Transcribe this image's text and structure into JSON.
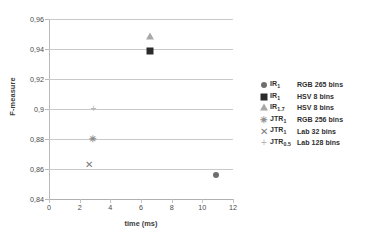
{
  "chart_data": {
    "type": "scatter",
    "title": "",
    "xlabel": "time (ms)",
    "ylabel": "F-measure",
    "xlim": [
      0,
      12
    ],
    "ylim": [
      0.84,
      0.96
    ],
    "x_ticks": [
      "0",
      "2",
      "4",
      "6",
      "8",
      "10",
      "12"
    ],
    "x_tick_values": [
      0,
      2,
      4,
      6,
      8,
      10,
      12
    ],
    "y_ticks": [
      "0,84",
      "0,86",
      "0,88",
      "0,9",
      "0,92",
      "0,94",
      "0,96"
    ],
    "y_tick_values": [
      0.84,
      0.86,
      0.88,
      0.9,
      0.92,
      0.94,
      0.96
    ],
    "grid": "horizontal",
    "legend_position": "right",
    "decimal_separator": ",",
    "series": [
      {
        "name": "IR1 RGB 265 bins",
        "label_name": "IR",
        "label_sub": "1",
        "label_desc": "RGB 265 bins",
        "marker": "circle",
        "color": "#6e6e6e",
        "x": [
          10.9
        ],
        "y": [
          0.856
        ]
      },
      {
        "name": "IR1 HSV 8 bins",
        "label_name": "IR",
        "label_sub": "1",
        "label_desc": "HSV 8 bins",
        "marker": "square",
        "color": "#2b2b2b",
        "x": [
          6.6
        ],
        "y": [
          0.939
        ]
      },
      {
        "name": "IR1.7 HSV 8 bins",
        "label_name": "IR",
        "label_sub": "1.7",
        "label_desc": "HSV 8 bins",
        "marker": "triangle",
        "color": "#a8a8a8",
        "x": [
          6.6
        ],
        "y": [
          0.948
        ]
      },
      {
        "name": "JTR1 RGB 256 bins",
        "label_name": "JTR",
        "label_sub": "1",
        "label_desc": "RGB 256 bins",
        "marker": "asterisk",
        "glyph": "✳",
        "color": "#8c8c8c",
        "x": [
          2.9
        ],
        "y": [
          0.88
        ]
      },
      {
        "name": "JTR1 Lab 32 bins",
        "label_name": "JTR",
        "label_sub": "1",
        "label_desc": "Lab 32 bins",
        "marker": "cross",
        "glyph": "✕",
        "color": "#7a7a7a",
        "x": [
          2.6
        ],
        "y": [
          0.863
        ]
      },
      {
        "name": "JTR0.5 Lab 128 bins",
        "label_name": "JTR",
        "label_sub": "0.5",
        "label_desc": "Lab 128 bins",
        "marker": "plus",
        "glyph": "+",
        "color": "#b4b4b4",
        "x": [
          2.9
        ],
        "y": [
          0.9
        ]
      }
    ]
  },
  "axes": {
    "y_title": "F-measure",
    "x_title": "time (ms)"
  },
  "colors": {
    "gridline": "#c9c9c9",
    "axis": "#b9b9b9",
    "text": "#3f3f3f",
    "background": "#ffffff"
  }
}
